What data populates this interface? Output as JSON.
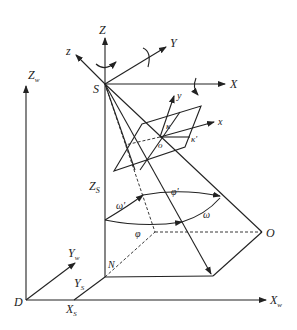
{
  "diagram": {
    "labels": {
      "Z": "Z",
      "X": "X",
      "Y": "Y",
      "z": "z",
      "S": "S",
      "y": "y",
      "x": "x",
      "o": "o",
      "kappa": "κ",
      "kappa_p": "κ'",
      "Zs": "Z",
      "Zs_sub": "S",
      "omega_p": "ω'",
      "phi_p": "φ'",
      "omega": "ω",
      "phi": "φ",
      "O": "O",
      "N": "N",
      "Zw": "Z",
      "Zw_sub": "w",
      "Yw": "Y",
      "Yw_sub": "w",
      "Ys": "Y",
      "Ys_sub": "S",
      "Xs": "X",
      "Xs_sub": "S",
      "Xw": "X",
      "Xw_sub": "w",
      "D": "D"
    }
  }
}
